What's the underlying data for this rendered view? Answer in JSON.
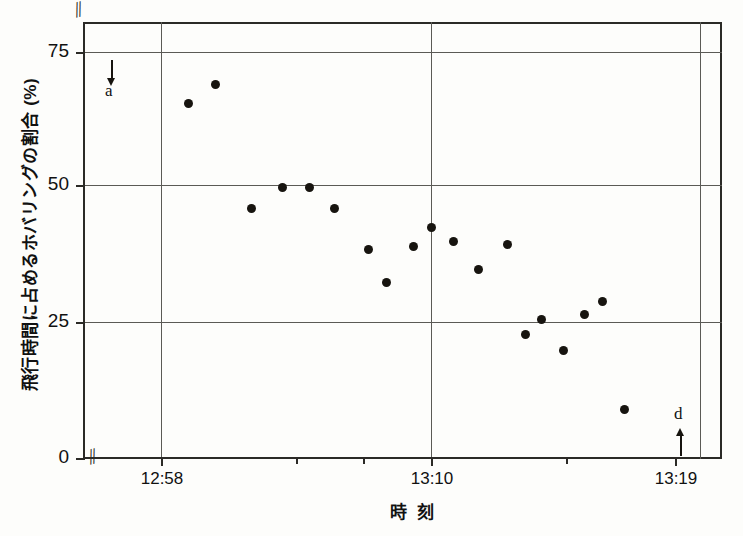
{
  "chart_data": {
    "type": "scatter",
    "title": "",
    "xlabel": "時 刻",
    "ylabel": "飛行時間に占めるホバリングの割合 (%)",
    "ylim": [
      0,
      75
    ],
    "yticks": [
      0,
      25,
      50,
      75
    ],
    "ytick_labels": [
      "0",
      "25",
      "50",
      "75"
    ],
    "xlim": [
      "12:57",
      "13:20"
    ],
    "xticks": [
      "12:58",
      "13:10",
      "13:19"
    ],
    "xtick_labels": [
      "12:58",
      "13:10",
      "13:19"
    ],
    "grid": true,
    "legend": null,
    "axis_break_x": true,
    "axis_break_y": true,
    "x_unit": "clock time (hh:mm)",
    "y_unit": "percent",
    "points": [
      {
        "time": "12:59.2",
        "x_min": 1.2,
        "value": 65.5
      },
      {
        "time": "13:00.4",
        "x_min": 2.4,
        "value": 69.0
      },
      {
        "time": "13:02.0",
        "x_min": 4.0,
        "value": 46.0
      },
      {
        "time": "13:03.4",
        "x_min": 5.4,
        "value": 50.0
      },
      {
        "time": "13:04.6",
        "x_min": 6.6,
        "value": 50.0
      },
      {
        "time": "13:05.7",
        "x_min": 7.7,
        "value": 46.0
      },
      {
        "time": "13:07.2",
        "x_min": 9.2,
        "value": 38.5
      },
      {
        "time": "13:08.0",
        "x_min": 10.0,
        "value": 32.5
      },
      {
        "time": "13:09.2",
        "x_min": 11.2,
        "value": 39.0
      },
      {
        "time": "13:10.0",
        "x_min": 12.0,
        "value": 42.5
      },
      {
        "time": "13:11.0",
        "x_min": 13.0,
        "value": 40.0
      },
      {
        "time": "13:12.1",
        "x_min": 14.1,
        "value": 34.8
      },
      {
        "time": "13:13.4",
        "x_min": 15.4,
        "value": 39.5
      },
      {
        "time": "13:14.2",
        "x_min": 16.2,
        "value": 22.8
      },
      {
        "time": "13:14.9",
        "x_min": 16.9,
        "value": 25.5
      },
      {
        "time": "13:15.9",
        "x_min": 17.9,
        "value": 19.8
      },
      {
        "time": "13:16.8",
        "x_min": 18.8,
        "value": 26.5
      },
      {
        "time": "13:17.6",
        "x_min": 19.6,
        "value": 29.0
      },
      {
        "time": "13:18.6",
        "x_min": 20.6,
        "value": 9.0
      }
    ],
    "annotations": [
      {
        "label": "a",
        "arrow": "down",
        "x_min": 0.5,
        "value_near": 72
      },
      {
        "label": "d",
        "arrow": "up",
        "x_min": 20.9,
        "value_near": 2
      }
    ],
    "colors": {
      "marker": "#17140f",
      "axis": "#2b2a26",
      "grid": "#5b5a55",
      "background": "#fdfdfb",
      "text": "#111111"
    }
  },
  "axis": {
    "y": {
      "ticks": [
        {
          "label": "75",
          "top_px": 30
        },
        {
          "label": "50",
          "top_px": 163
        },
        {
          "label": "25",
          "top_px": 300
        },
        {
          "label": "0",
          "top_px": 436
        }
      ],
      "break_mark": "//"
    },
    "x": {
      "ticks": [
        {
          "label": "12:58",
          "left_px": 78,
          "minor": false
        },
        {
          "label": "",
          "left_px": 213,
          "minor": true
        },
        {
          "label": "",
          "left_px": 280,
          "minor": true
        },
        {
          "label": "13:10",
          "left_px": 348,
          "minor": false
        },
        {
          "label": "",
          "left_px": 483,
          "minor": true
        },
        {
          "label": "13:19",
          "left_px": 592,
          "minor": false
        }
      ],
      "break_mark": "//"
    },
    "gridlines": {
      "horizontal_px": [
        30,
        163,
        300
      ],
      "vertical_px": [
        78,
        348,
        617
      ]
    }
  },
  "labels": {
    "y_title": "飛行時間に占めるホバリングの割合 (%)",
    "x_title": "時 刻",
    "annotation_a": "a",
    "annotation_d": "d"
  }
}
